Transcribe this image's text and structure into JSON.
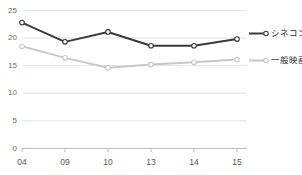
{
  "chart_data": {
    "type": "line",
    "title": "",
    "xlabel": "",
    "ylabel": "",
    "x": [
      "04",
      "09",
      "10",
      "13",
      "14",
      "15"
    ],
    "categories": [
      "04",
      "09",
      "10",
      "13",
      "14",
      "15"
    ],
    "series": [
      {
        "name": "シネコン",
        "color": "#3a3a3a",
        "values": [
          22.8,
          19.3,
          21.1,
          18.6,
          18.6,
          19.8
        ]
      },
      {
        "name": "一般映画館",
        "color": "#c8c8c8",
        "values": [
          18.5,
          16.4,
          14.6,
          15.2,
          15.6,
          16.1
        ]
      }
    ],
    "ylim": [
      0,
      25
    ],
    "yticks": [
      0,
      5,
      10,
      15,
      20,
      25
    ],
    "ytick_labels": [
      "0",
      "5",
      "10",
      "15",
      "20",
      "25"
    ],
    "xtick_labels": [
      "04",
      "09",
      "10",
      "13",
      "14",
      "15"
    ],
    "grid": true,
    "legend_position": "right",
    "marker": "circle-open"
  },
  "axes": {
    "y": {
      "labels": [
        {
          "text": "25"
        },
        {
          "text": "20"
        },
        {
          "text": "15"
        },
        {
          "text": "10"
        },
        {
          "text": "5"
        },
        {
          "text": "0"
        }
      ]
    },
    "x": {
      "labels": [
        {
          "text": "04"
        },
        {
          "text": "09"
        },
        {
          "text": "10"
        },
        {
          "text": "13"
        },
        {
          "text": "14"
        },
        {
          "text": "15"
        }
      ]
    }
  },
  "legend": {
    "items": [
      {
        "label": "シネコン",
        "color": "#3a3a3a"
      },
      {
        "label": "一般映画館",
        "color": "#c8c8c8"
      }
    ]
  },
  "colors": {
    "series_dark": "#3a3a3a",
    "series_light": "#c8c8c8",
    "grid": "#dcdcdc",
    "axis": "#b4b4b4",
    "tick_text": "#6e6e6e",
    "background": "#ffffff"
  }
}
